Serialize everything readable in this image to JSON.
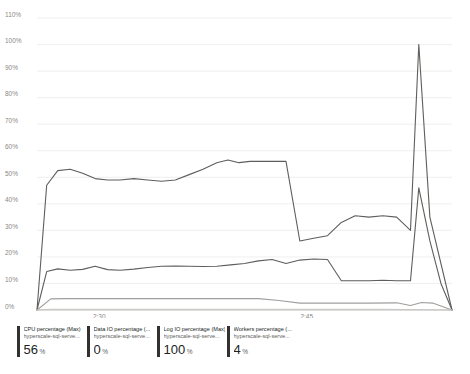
{
  "chart_data": {
    "type": "line",
    "title": "",
    "xlabel": "",
    "ylabel": "",
    "ylim": [
      0,
      110
    ],
    "yunit": "%",
    "grid": true,
    "legend_position": "bottom",
    "ytick_labels": [
      "0%",
      "10%",
      "20%",
      "30%",
      "40%",
      "50%",
      "60%",
      "70%",
      "80%",
      "90%",
      "100%",
      "110%"
    ],
    "ytick_values": [
      0,
      10,
      20,
      30,
      40,
      50,
      60,
      70,
      80,
      90,
      100,
      110
    ],
    "xtick_labels": [
      "2:30",
      "2:45"
    ],
    "xtick_values": [
      4.5,
      19.5
    ],
    "xlim": [
      0,
      30
    ],
    "series": [
      {
        "name": "CPU percentage (Max)",
        "resource": "hyperscale-sql-serve...",
        "value": "56",
        "unit": "%",
        "color": "#605e5c",
        "x": [
          0,
          0.7,
          1.5,
          2.4,
          3.3,
          4.2,
          5.1,
          6.0,
          7.0,
          8.0,
          9.0,
          10.0,
          11.0,
          12.0,
          13.0,
          14.0,
          15.0,
          16.0,
          17.0,
          18.0,
          19.0,
          20.0,
          21.0,
          22.0,
          23.0,
          24.0,
          25.0,
          26.0,
          27.0,
          27.6,
          28.4,
          29.2,
          30.0
        ],
        "y": [
          0,
          14.5,
          15.5,
          15.0,
          15.3,
          16.5,
          15.2,
          15.0,
          15.4,
          16.0,
          16.5,
          16.6,
          16.5,
          16.4,
          16.5,
          17.0,
          17.5,
          18.5,
          19.0,
          17.5,
          18.8,
          19.2,
          19.0,
          11.0,
          11.0,
          11.0,
          11.2,
          11.0,
          11.0,
          46.0,
          26.0,
          10.0,
          0
        ]
      },
      {
        "name": "Data IO percentage (...",
        "resource": "hyperscale-sql-serve...",
        "value": "0",
        "unit": "%",
        "color": "#c8c6c4",
        "x": [
          0,
          1.0,
          5.0,
          10.0,
          15.0,
          20.0,
          25.0,
          30.0
        ],
        "y": [
          0,
          0.3,
          0.3,
          0.3,
          0.3,
          0.3,
          0.3,
          0
        ]
      },
      {
        "name": "Log IO percentage (Max)",
        "resource": "hyperscale-sql-serve...",
        "value": "100",
        "unit": "%",
        "color": "#605e5c",
        "x": [
          0,
          0.7,
          1.5,
          2.4,
          3.3,
          4.2,
          5.1,
          6.0,
          7.0,
          8.0,
          9.0,
          10.0,
          11.0,
          12.0,
          13.0,
          13.8,
          14.6,
          15.4,
          16.2,
          17.0,
          18.0,
          19.0,
          20.0,
          21.0,
          22.0,
          23.0,
          24.0,
          25.0,
          26.0,
          27.0,
          27.6,
          28.4,
          30.0
        ],
        "y": [
          0,
          47.0,
          52.5,
          53.0,
          51.5,
          49.5,
          49.0,
          49.0,
          49.5,
          49.0,
          48.5,
          49.0,
          51.0,
          53.0,
          55.5,
          56.5,
          55.5,
          56.0,
          56.0,
          56.0,
          56.0,
          26.0,
          27.0,
          28.0,
          33.0,
          35.5,
          35.0,
          35.5,
          35.0,
          30.0,
          100.0,
          35.0,
          0
        ]
      },
      {
        "name": "Workers percentage (...",
        "resource": "hyperscale-sql-serve...",
        "value": "4",
        "unit": "%",
        "color": "#a19f9d",
        "x": [
          0,
          1.0,
          2.0,
          5.0,
          9.0,
          13.0,
          16.0,
          17.5,
          19.0,
          21.0,
          24.0,
          26.0,
          27.0,
          27.8,
          28.6,
          30.0
        ],
        "y": [
          0,
          4.2,
          4.3,
          4.3,
          4.3,
          4.3,
          4.3,
          3.6,
          2.6,
          2.6,
          2.6,
          2.7,
          1.7,
          2.8,
          2.6,
          0
        ]
      }
    ]
  },
  "legend": {
    "items": [
      {
        "metric": "CPU percentage (Max)",
        "resource": "hyperscale-sql-serve...",
        "value": "56",
        "unit": "%",
        "color": "#323130"
      },
      {
        "metric": "Data IO percentage (...",
        "resource": "hyperscale-sql-serve...",
        "value": "0",
        "unit": "%",
        "color": "#323130"
      },
      {
        "metric": "Log IO percentage (Max)",
        "resource": "hyperscale-sql-serve...",
        "value": "100",
        "unit": "%",
        "color": "#323130"
      },
      {
        "metric": "Workers percentage (...",
        "resource": "hyperscale-sql-serve...",
        "value": "4",
        "unit": "%",
        "color": "#323130"
      }
    ]
  }
}
